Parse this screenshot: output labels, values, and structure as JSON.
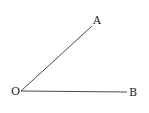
{
  "diagram": {
    "type": "angle",
    "points": {
      "O": {
        "label": "O",
        "x": 21,
        "y": 91
      },
      "A": {
        "label": "A",
        "x": 92,
        "y": 26
      },
      "B": {
        "label": "B",
        "x": 127,
        "y": 92
      }
    },
    "rays": [
      {
        "from": "O",
        "to": "A"
      },
      {
        "from": "O",
        "to": "B"
      }
    ],
    "stroke_color": "#333333",
    "label_color": "#222222"
  }
}
